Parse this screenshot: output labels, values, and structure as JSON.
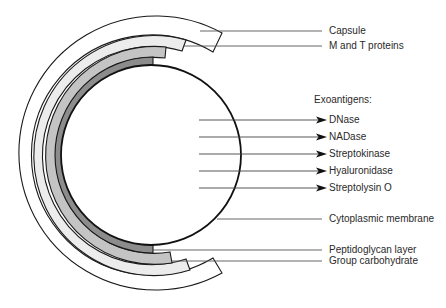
{
  "diagram": {
    "colors": {
      "capsule": "#ffffff",
      "m_t_proteins": "#ececec",
      "group_carbohydrate": "#c4c4c4",
      "peptidoglycan": "#8c8c8c",
      "outline": "#1a1a1a",
      "leader": "#555555"
    },
    "labels": {
      "capsule": "Capsule",
      "m_and_t_proteins": "M and T proteins",
      "exoantigens_heading": "Exoantigens:",
      "cytoplasmic_membrane": "Cytoplasmic membrane",
      "peptidoglycan_layer": "Peptidoglycan layer",
      "group_carbohydrate": "Group carbohydrate"
    },
    "exoantigens": [
      "DNase",
      "NADase",
      "Streptokinase",
      "Hyaluronidase",
      "Streptolysin O"
    ]
  }
}
